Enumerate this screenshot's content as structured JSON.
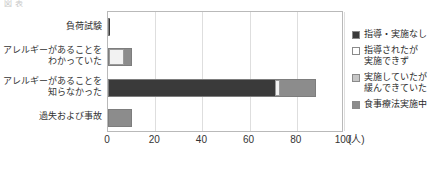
{
  "top_strip": {
    "text": "図表"
  },
  "chart_data": {
    "type": "bar",
    "orientation": "horizontal",
    "stacked": true,
    "title": "",
    "subtitle": "",
    "xlabel": "",
    "ylabel": "",
    "xunit": "(人)",
    "xlim": [
      0,
      100
    ],
    "xticks": [
      0,
      20,
      40,
      60,
      80,
      100
    ],
    "xtick_labels": [
      "0",
      "20",
      "40",
      "60",
      "80",
      "100"
    ],
    "grid": "vertical",
    "legend_position": "right",
    "categories": [
      "負荷試験",
      "アレルギーがあることを\nわかっていた",
      "アレルギーがあることを\n知らなかった",
      "過失および事故"
    ],
    "series": [
      {
        "name": "指導・実施なし",
        "color": "#3a3a3a",
        "values": [
          1,
          0,
          71,
          0
        ]
      },
      {
        "name": "指導されたが\n実施できず",
        "color": "#f2f2f2",
        "values": [
          0,
          7,
          2,
          0
        ]
      },
      {
        "name": "実施していたが\n緩んできていた",
        "color": "#b5b5b5",
        "values": [
          0,
          0,
          0,
          0
        ]
      },
      {
        "name": "食事療法実施中",
        "color": "#8c8c8c",
        "values": [
          0,
          3,
          15,
          10
        ]
      }
    ],
    "totals": [
      1,
      10,
      88,
      10
    ]
  },
  "legend": {
    "items": [
      {
        "label": "指導・実施なし",
        "color": "#3a3a3a"
      },
      {
        "label": "指導されたが\n実施できず",
        "color": "#ffffff"
      },
      {
        "label": "実施していたが\n緩んできていた",
        "color": "#c6c6c6"
      },
      {
        "label": "食事療法実施中",
        "color": "#8c8c8c"
      }
    ]
  }
}
